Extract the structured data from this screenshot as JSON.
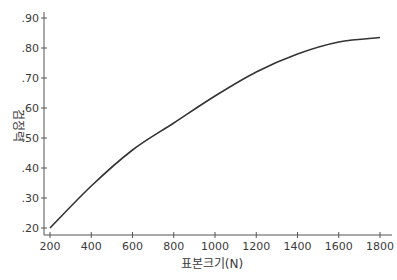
{
  "chart_data": {
    "type": "line",
    "title": "",
    "xlabel": "표본크기(N)",
    "ylabel": "검정력",
    "x": [
      200,
      400,
      600,
      800,
      1000,
      1200,
      1400,
      1600,
      1800
    ],
    "series": [
      {
        "name": "검정력",
        "values": [
          0.2,
          0.34,
          0.46,
          0.55,
          0.64,
          0.72,
          0.78,
          0.82,
          0.835
        ]
      }
    ],
    "xlim": [
      200,
      1800
    ],
    "ylim": [
      0.2,
      0.9
    ],
    "x_ticks": [
      200,
      400,
      600,
      800,
      1000,
      1200,
      1400,
      1600,
      1800
    ],
    "y_ticks": [
      0.2,
      0.3,
      0.4,
      0.5,
      0.6,
      0.7,
      0.8,
      0.9
    ],
    "y_tick_labels": [
      ".20",
      ".30",
      ".40",
      ".50",
      ".60",
      ".70",
      ".80",
      ".90"
    ],
    "grid": false,
    "legend": "none",
    "line_color": "#333333"
  }
}
